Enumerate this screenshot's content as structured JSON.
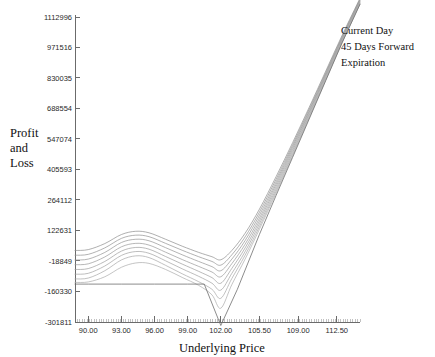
{
  "chart_data": {
    "type": "line",
    "title": "",
    "xlabel": "Underlying Price",
    "ylabel": "Profit and Loss",
    "ylabel_lines": [
      "Profit",
      "and",
      "Loss"
    ],
    "grid": false,
    "legend_position": "top-right",
    "xlim": [
      88.8,
      114.6
    ],
    "ylim": [
      -301811,
      1112996
    ],
    "xticks": [
      "90.00",
      "93.00",
      "96.00",
      "99.00",
      "102.00",
      "105.50",
      "109.00",
      "112.50"
    ],
    "xtick_values": [
      90.0,
      93.0,
      96.0,
      99.0,
      102.0,
      105.5,
      109.0,
      112.5
    ],
    "yticks": [
      "1112996",
      "971516",
      "830035",
      "688554",
      "547074",
      "405593",
      "264112",
      "122631",
      "-18849",
      "-160330",
      "-301811"
    ],
    "ytick_values": [
      1112996,
      971516,
      830035,
      688554,
      547074,
      405593,
      264112,
      122631,
      -18849,
      -160330,
      -301811
    ],
    "legend": [
      "Current Day",
      "45 Days Forward",
      "Expiration"
    ],
    "series": [
      {
        "name": "Current Day",
        "color": "#8c8c8c",
        "x": [
          88.8,
          90.0,
          91.5,
          93.0,
          94.3,
          95.5,
          97.0,
          98.5,
          100.0,
          101.2,
          102.0,
          103.0,
          104.2,
          105.5,
          107.0,
          108.5,
          110.0,
          111.5,
          113.0,
          114.6
        ],
        "values": [
          30000,
          34000,
          62000,
          104000,
          119000,
          112000,
          82000,
          50000,
          21000,
          1000,
          -13000,
          30000,
          110000,
          222000,
          372000,
          530000,
          694000,
          862000,
          1030000,
          1200000
        ]
      },
      {
        "name": "Day 2",
        "color": "#909090",
        "x": [
          88.8,
          90.0,
          91.5,
          93.0,
          94.3,
          95.5,
          97.0,
          98.5,
          100.0,
          101.2,
          102.0,
          103.0,
          104.2,
          105.5,
          107.0,
          108.5,
          110.0,
          111.5,
          113.0,
          114.6
        ],
        "values": [
          8000,
          12000,
          42000,
          86000,
          101000,
          94000,
          63000,
          31000,
          1000,
          -21000,
          -38000,
          10000,
          93000,
          208000,
          360000,
          520000,
          686000,
          855000,
          1024000,
          1196000
        ]
      },
      {
        "name": "Day 3",
        "color": "#949494",
        "x": [
          88.8,
          90.0,
          91.5,
          93.0,
          94.3,
          95.5,
          97.0,
          98.5,
          100.0,
          101.2,
          102.0,
          103.0,
          104.2,
          105.5,
          107.0,
          108.5,
          110.0,
          111.5,
          113.0,
          114.6
        ],
        "values": [
          -14000,
          -10000,
          21000,
          67000,
          82000,
          75000,
          43000,
          10000,
          -21000,
          -45000,
          -64000,
          -10000,
          76000,
          194000,
          348000,
          511000,
          678000,
          849000,
          1019000,
          1192000
        ]
      },
      {
        "name": "Day 4",
        "color": "#989898",
        "x": [
          88.8,
          90.0,
          91.5,
          93.0,
          94.3,
          95.5,
          97.0,
          98.5,
          100.0,
          101.2,
          102.0,
          103.0,
          104.2,
          105.5,
          107.0,
          108.5,
          110.0,
          111.5,
          113.0,
          114.6
        ],
        "values": [
          -36000,
          -32000,
          0,
          47000,
          63000,
          55000,
          22000,
          -12000,
          -44000,
          -70000,
          -92000,
          -31000,
          59000,
          180000,
          337000,
          502000,
          671000,
          843000,
          1014000,
          1188000
        ]
      },
      {
        "name": "Day 5",
        "color": "#9c9c9c",
        "x": [
          88.8,
          90.0,
          91.5,
          93.0,
          94.3,
          95.5,
          97.0,
          98.5,
          100.0,
          101.2,
          102.0,
          103.0,
          104.2,
          105.5,
          107.0,
          108.5,
          110.0,
          111.5,
          113.0,
          114.6
        ],
        "values": [
          -58000,
          -54000,
          -21000,
          27000,
          44000,
          36000,
          2000,
          -33000,
          -67000,
          -96000,
          -122000,
          -53000,
          42000,
          167000,
          326000,
          493000,
          664000,
          837000,
          1009000,
          1184000
        ]
      },
      {
        "name": "45 Days Forward",
        "color": "#a0a0a0",
        "x": [
          88.8,
          90.0,
          91.5,
          93.0,
          94.3,
          95.5,
          97.0,
          98.5,
          100.0,
          101.2,
          102.0,
          103.0,
          104.2,
          105.5,
          107.0,
          108.5,
          110.0,
          111.5,
          113.0,
          114.6
        ],
        "values": [
          -80000,
          -76000,
          -42000,
          7000,
          25000,
          17000,
          -18000,
          -55000,
          -90000,
          -122000,
          -154000,
          -76000,
          25000,
          154000,
          315000,
          484000,
          657000,
          831000,
          1004000,
          1180000
        ]
      },
      {
        "name": "Day 7",
        "color": "#a6a6a6",
        "x": [
          88.8,
          90.0,
          91.5,
          93.0,
          94.3,
          95.5,
          97.0,
          98.5,
          100.0,
          101.2,
          102.0,
          103.0,
          104.2,
          105.5,
          107.0,
          108.5,
          110.0,
          111.5,
          113.0,
          114.6
        ],
        "values": [
          -102000,
          -98000,
          -64000,
          -14000,
          5000,
          -3000,
          -39000,
          -78000,
          -115000,
          -150000,
          -192000,
          -100000,
          8000,
          141000,
          305000,
          476000,
          650000,
          825000,
          1000000,
          1176000
        ]
      },
      {
        "name": "Day 8",
        "color": "#ababab",
        "x": [
          88.8,
          90.0,
          91.5,
          93.0,
          94.3,
          95.5,
          97.0,
          98.5,
          100.0,
          101.2,
          102.0,
          103.0,
          104.2,
          105.5,
          107.0,
          108.5,
          110.0,
          111.5,
          113.0,
          114.6
        ],
        "values": [
          -118000,
          -116000,
          -92000,
          -48000,
          -28000,
          -30000,
          -58000,
          -95000,
          -132000,
          -176000,
          -238000,
          -128000,
          -10000,
          129000,
          296000,
          469000,
          645000,
          821000,
          996000,
          1173000
        ]
      },
      {
        "name": "Expiration",
        "color": "#6f6f6f",
        "x": [
          88.8,
          90.0,
          93.0,
          96.0,
          99.0,
          100.5,
          102.0,
          103.5,
          105.5,
          107.0,
          108.5,
          110.0,
          111.5,
          113.0,
          114.6
        ],
        "values": [
          -126000,
          -126000,
          -126000,
          -126000,
          -126000,
          -126000,
          -318000,
          -150000,
          105000,
          285000,
          462000,
          640000,
          818000,
          996000,
          1172000
        ]
      }
    ]
  }
}
